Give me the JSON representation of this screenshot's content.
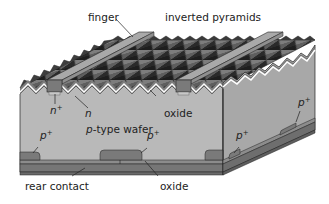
{
  "figure": {
    "kind": "3D cross-section of PERL-type silicon solar cell",
    "labels": {
      "finger": "finger",
      "inverted_pyramids": "inverted pyramids",
      "n_plus": "n",
      "n_plus_sup": "+",
      "n": "n",
      "oxide_front": "oxide",
      "p_type_wafer_prefix": "p",
      "p_type_wafer_suffix": "-type wafer",
      "p_plus_a": "p",
      "p_plus_b": "p",
      "p_plus_c": "p",
      "p_plus_d": "p",
      "p_plus_sup": "+",
      "rear_contact": "rear contact",
      "oxide_rear": "oxide"
    },
    "colors": {
      "wafer_front": "#b9b9b9",
      "wafer_side": "#a6a6a6",
      "pyramid_dark": "#2e2e2e",
      "pyramid_mid": "#5a5a5a",
      "pyramid_light": "#8a8a8a",
      "oxide_line": "#ffffff",
      "n_layer": "#7d7d7d",
      "finger_top": "#a9a9a9",
      "finger_front": "#7a7a7a",
      "finger_side": "#8f8f8f",
      "p_plus": "#7a7a7a",
      "rear_metal": "#777777",
      "rear_metal_side": "#6a6a6a",
      "outline": "#222222",
      "text": "#222222"
    }
  }
}
